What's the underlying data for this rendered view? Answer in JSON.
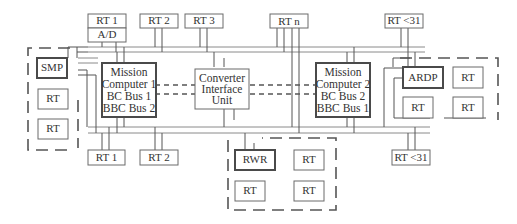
{
  "diagram": {
    "top_rts": [
      {
        "label": "RT 1",
        "sublabel": "A/D"
      },
      {
        "label": "RT 2"
      },
      {
        "label": "RT 3"
      },
      {
        "label": "RT n"
      },
      {
        "label": "RT <31"
      }
    ],
    "bottom_rts": [
      {
        "label": "RT 1"
      },
      {
        "label": "RT 2"
      },
      {
        "label": "RT <31"
      }
    ],
    "mission_computer_1": {
      "lines": [
        "Mission",
        "Computer 1",
        "BC Bus 1",
        "BBC Bus 2"
      ]
    },
    "mission_computer_2": {
      "lines": [
        "Mission",
        "Computer 2",
        "BC Bus 2",
        "BBC Bus 1"
      ]
    },
    "converter": {
      "lines": [
        "Converter",
        "Interface",
        "Unit"
      ]
    },
    "groups": {
      "smp_group": {
        "labels": [
          "SMP",
          "RT",
          "RT"
        ]
      },
      "ardp_group": {
        "labels": [
          "ARDP",
          "RT",
          "RT",
          "RT"
        ]
      },
      "rwr_group": {
        "labels": [
          "RWR",
          "RT",
          "RT",
          "RT"
        ]
      }
    },
    "colors": {
      "line": "#555555",
      "bus": "#8a8a8a",
      "text": "#333333"
    }
  }
}
